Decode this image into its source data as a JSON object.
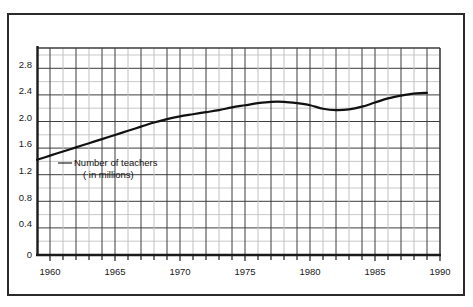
{
  "chart_data": {
    "type": "line",
    "title": "",
    "subtitle": "",
    "xlabel": "",
    "ylabel": "",
    "xlim": [
      1959,
      1990
    ],
    "ylim": [
      0,
      3.0
    ],
    "grid": true,
    "legend_position": "none",
    "annotations": [
      {
        "text_line1": "Number of teachers",
        "text_line2": "( in millions)",
        "x": 1963.5,
        "y": 1.5
      }
    ],
    "x_ticks": [
      1960,
      1965,
      1970,
      1975,
      1980,
      1985,
      1990
    ],
    "x_tick_labels": [
      "1960",
      "1965",
      "1970",
      "1975",
      "1980",
      "1985",
      "1990"
    ],
    "x_minor_tick_interval": 1,
    "y_ticks": [
      0,
      0.4,
      0.8,
      1.2,
      1.6,
      2.0,
      2.4,
      2.8
    ],
    "y_tick_labels": [
      "0",
      "0.4",
      "0.8",
      "1.2",
      "1.6",
      "2.0",
      "2.4",
      "2.8"
    ],
    "y_minor_gridline_interval": 0.2,
    "series": [
      {
        "name": "Number of teachers (in millions)",
        "color": "#111111",
        "x": [
          1959,
          1960,
          1961,
          1962,
          1963,
          1964,
          1965,
          1966,
          1967,
          1968,
          1969,
          1970,
          1971,
          1972,
          1973,
          1974,
          1975,
          1976,
          1977,
          1978,
          1979,
          1980,
          1981,
          1982,
          1983,
          1984,
          1985,
          1986,
          1987,
          1988,
          1989
        ],
        "values": [
          1.38,
          1.44,
          1.5,
          1.56,
          1.62,
          1.68,
          1.74,
          1.8,
          1.86,
          1.92,
          1.97,
          2.01,
          2.04,
          2.07,
          2.1,
          2.14,
          2.17,
          2.2,
          2.22,
          2.22,
          2.2,
          2.17,
          2.12,
          2.1,
          2.11,
          2.15,
          2.21,
          2.27,
          2.31,
          2.34,
          2.35
        ]
      }
    ]
  },
  "axes": {
    "y_labels": [
      "2.8",
      "2.4",
      "2.0",
      "1.6",
      "1.2",
      "0.8",
      "0.4",
      "0"
    ],
    "x_labels": [
      "1960",
      "1965",
      "1970",
      "1975",
      "1980",
      "1985",
      "1990"
    ]
  },
  "annotation": {
    "line1": "Number of teachers",
    "line2": "( in millions)"
  },
  "colors": {
    "curve": "#111111",
    "axis": "#1a1a1a",
    "grid_major": "#3d3d3d",
    "grid_minor": "#c9c9c9",
    "frame": "#2b2b2b",
    "background": "#ffffff"
  }
}
